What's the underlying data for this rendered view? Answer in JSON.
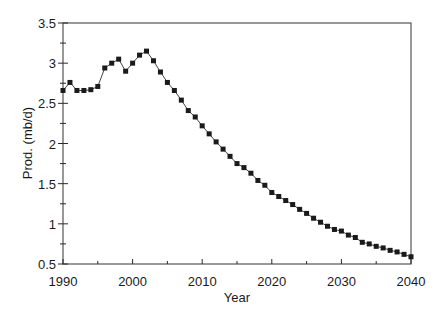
{
  "chart_data": {
    "type": "line",
    "title": "",
    "xlabel": "Year",
    "ylabel": "Prod. (mb/d)",
    "xlim": [
      1990,
      2040
    ],
    "ylim": [
      0.5,
      3.5
    ],
    "x_ticks": [
      1990,
      2000,
      2010,
      2020,
      2030,
      2040
    ],
    "x_minor_step": 5,
    "y_ticks": [
      0.5,
      1,
      1.5,
      2,
      2.5,
      3,
      3.5
    ],
    "y_tick_labels": [
      "0.5",
      "1",
      "1.5",
      "2",
      "2.5",
      "3",
      "3.5"
    ],
    "y_minor_step": 0.25,
    "grid": false,
    "legend": null,
    "marker": "square",
    "series": [
      {
        "name": "Production",
        "color": "#1a1a1a",
        "x": [
          1990,
          1991,
          1992,
          1993,
          1994,
          1995,
          1996,
          1997,
          1998,
          1999,
          2000,
          2001,
          2002,
          2003,
          2004,
          2005,
          2006,
          2007,
          2008,
          2009,
          2010,
          2011,
          2012,
          2013,
          2014,
          2015,
          2016,
          2017,
          2018,
          2019,
          2020,
          2021,
          2022,
          2023,
          2024,
          2025,
          2026,
          2027,
          2028,
          2029,
          2030,
          2031,
          2032,
          2033,
          2034,
          2035,
          2036,
          2037,
          2038,
          2039,
          2040
        ],
        "values": [
          2.66,
          2.76,
          2.66,
          2.66,
          2.67,
          2.71,
          2.94,
          3.0,
          3.05,
          2.9,
          3.0,
          3.1,
          3.15,
          3.03,
          2.89,
          2.76,
          2.66,
          2.54,
          2.41,
          2.33,
          2.22,
          2.12,
          2.02,
          1.93,
          1.84,
          1.75,
          1.7,
          1.63,
          1.54,
          1.48,
          1.39,
          1.34,
          1.29,
          1.24,
          1.18,
          1.13,
          1.07,
          1.02,
          0.97,
          0.93,
          0.91,
          0.86,
          0.83,
          0.77,
          0.75,
          0.72,
          0.7,
          0.67,
          0.65,
          0.62,
          0.59
        ]
      }
    ]
  }
}
